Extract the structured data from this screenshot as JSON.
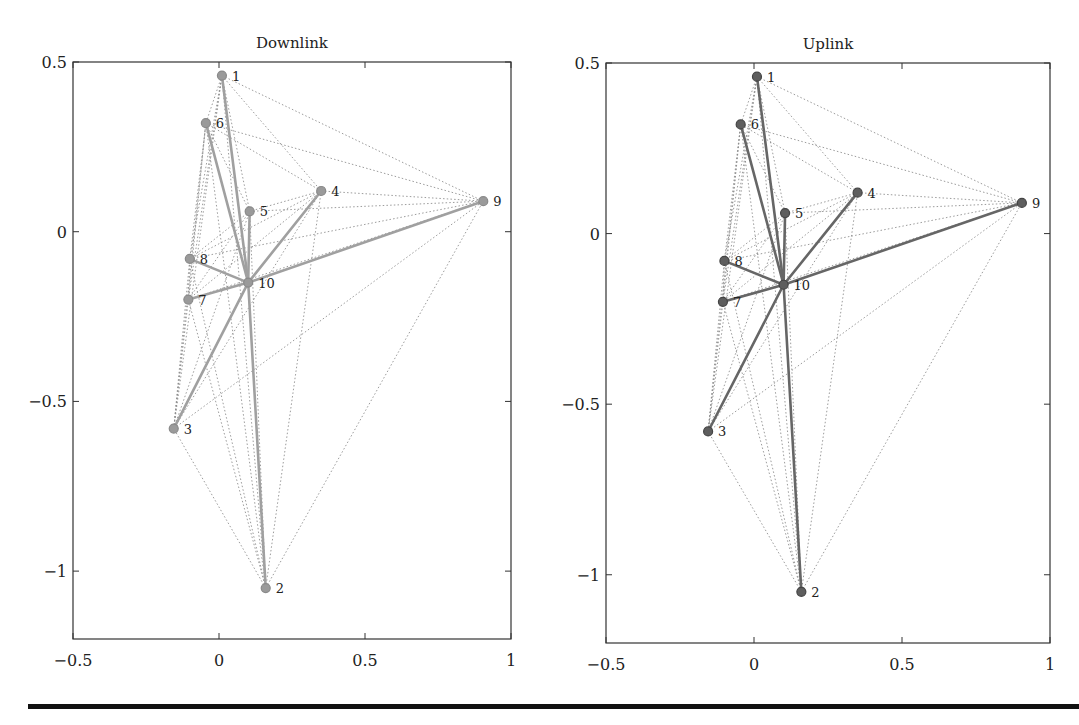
{
  "chart_data": [
    {
      "type": "network",
      "title": "Downlink",
      "xlabel": "",
      "ylabel": "",
      "xlim": [
        -0.5,
        1
      ],
      "ylim": [
        -1.2,
        0.5
      ],
      "xticks": [
        -0.5,
        0,
        0.5,
        1
      ],
      "xtick_labels": [
        "−0.5",
        "0",
        "0.5",
        "1"
      ],
      "yticks": [
        0.5,
        0,
        -0.5,
        -1
      ],
      "ytick_labels": [
        "0.5",
        "0",
        "−0.5",
        "−1"
      ],
      "grid": false,
      "nodes": [
        {
          "id": "1",
          "x": 0.01,
          "y": 0.46
        },
        {
          "id": "2",
          "x": 0.16,
          "y": -1.05
        },
        {
          "id": "3",
          "x": -0.155,
          "y": -0.58
        },
        {
          "id": "4",
          "x": 0.35,
          "y": 0.12
        },
        {
          "id": "5",
          "x": 0.105,
          "y": 0.06
        },
        {
          "id": "6",
          "x": -0.045,
          "y": 0.32
        },
        {
          "id": "7",
          "x": -0.105,
          "y": -0.2
        },
        {
          "id": "8",
          "x": -0.1,
          "y": -0.08
        },
        {
          "id": "9",
          "x": 0.905,
          "y": 0.09
        },
        {
          "id": "10",
          "x": 0.1,
          "y": -0.15
        }
      ],
      "solid_edges": [
        [
          "10",
          "1"
        ],
        [
          "10",
          "2"
        ],
        [
          "10",
          "3"
        ],
        [
          "10",
          "4"
        ],
        [
          "10",
          "5"
        ],
        [
          "10",
          "6"
        ],
        [
          "10",
          "7"
        ],
        [
          "10",
          "8"
        ],
        [
          "10",
          "9"
        ]
      ],
      "dotted_edges": "all-pairs",
      "colors": {
        "node": "#9a9a9a",
        "node_ring": "#8a8a8a",
        "solid": "#a0a0a0",
        "dotted": "#8c8c8c"
      }
    },
    {
      "type": "network",
      "title": "Uplink",
      "xlabel": "",
      "ylabel": "",
      "xlim": [
        -0.5,
        1
      ],
      "ylim": [
        -1.2,
        0.5
      ],
      "xticks": [
        -0.5,
        0,
        0.5,
        1
      ],
      "xtick_labels": [
        "−0.5",
        "0",
        "0.5",
        "1"
      ],
      "yticks": [
        0.5,
        0,
        -0.5,
        -1
      ],
      "ytick_labels": [
        "0.5",
        "0",
        "−0.5",
        "−1"
      ],
      "grid": false,
      "nodes": [
        {
          "id": "1",
          "x": 0.01,
          "y": 0.46
        },
        {
          "id": "2",
          "x": 0.16,
          "y": -1.05
        },
        {
          "id": "3",
          "x": -0.155,
          "y": -0.58
        },
        {
          "id": "4",
          "x": 0.35,
          "y": 0.12
        },
        {
          "id": "5",
          "x": 0.105,
          "y": 0.06
        },
        {
          "id": "6",
          "x": -0.045,
          "y": 0.32
        },
        {
          "id": "7",
          "x": -0.105,
          "y": -0.2
        },
        {
          "id": "8",
          "x": -0.1,
          "y": -0.08
        },
        {
          "id": "9",
          "x": 0.905,
          "y": 0.09
        },
        {
          "id": "10",
          "x": 0.1,
          "y": -0.15
        }
      ],
      "solid_edges": [
        [
          "10",
          "1"
        ],
        [
          "10",
          "2"
        ],
        [
          "10",
          "3"
        ],
        [
          "10",
          "4"
        ],
        [
          "10",
          "5"
        ],
        [
          "10",
          "6"
        ],
        [
          "10",
          "7"
        ],
        [
          "10",
          "8"
        ],
        [
          "10",
          "9"
        ]
      ],
      "dotted_edges": "all-pairs",
      "colors": {
        "node": "#5e5e5e",
        "node_ring": "#444444",
        "solid": "#666666",
        "dotted": "#8c8c8c"
      }
    }
  ],
  "layout": {
    "panels": [
      {
        "left": 73,
        "top": 62,
        "right": 511,
        "bottom": 639
      },
      {
        "left": 606,
        "top": 63,
        "right": 1050,
        "bottom": 643
      }
    ]
  }
}
